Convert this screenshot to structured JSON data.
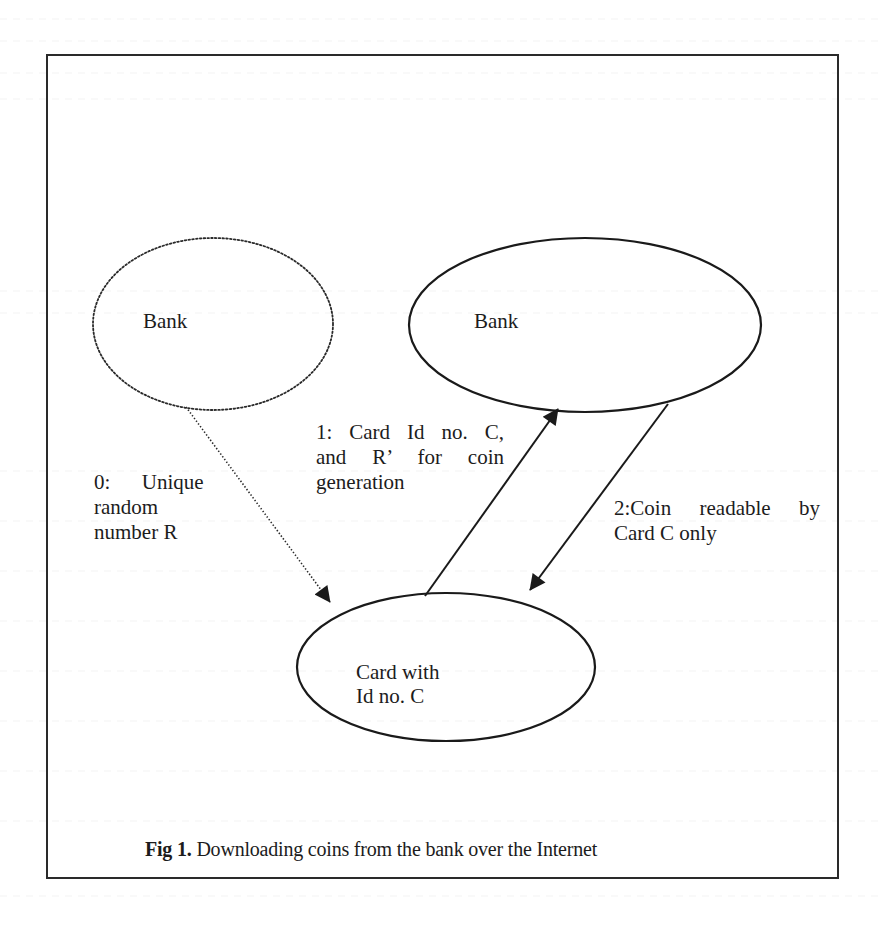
{
  "figure": {
    "caption_prefix": "Fig 1.",
    "caption_text": " Downloading coins from the bank over the Internet"
  },
  "nodes": {
    "bank_source": {
      "label": "Bank",
      "style": "dotted"
    },
    "bank_server": {
      "label": "Bank",
      "style": "solid"
    },
    "card": {
      "label_line1": "Card with",
      "label_line2": "Id no. C",
      "style": "solid"
    }
  },
  "edges": {
    "edge0": {
      "from": "Bank (dotted)",
      "to": "Card with Id no. C",
      "style": "dotted",
      "label_line1": "0:      Unique",
      "label_line2": "random",
      "label_line3": "number R"
    },
    "edge1": {
      "from": "Card with Id no. C",
      "to": "Bank",
      "style": "solid",
      "label_line1": "1: Card Id no. C,",
      "label_line2": "and R’ for coin",
      "label_line3": "generation"
    },
    "edge2": {
      "from": "Bank",
      "to": "Card with Id no. C",
      "style": "solid",
      "label_line1": "2:Coin readable by",
      "label_line2": "Card C only"
    }
  },
  "colors": {
    "stroke": "#1a1a1a",
    "frame": "#2a2a2a",
    "background": "#ffffff"
  }
}
